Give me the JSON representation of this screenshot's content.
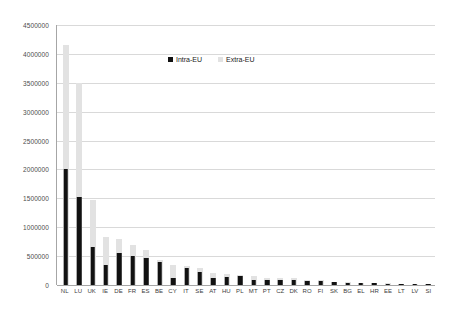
{
  "chart_data": {
    "type": "bar",
    "title": "",
    "subtitle": "",
    "xlabel": "",
    "ylabel": "",
    "ylim": [
      0,
      4500000
    ],
    "ytick_step": 500000,
    "ytick_labels": [
      "4500000",
      "4000000",
      "3500000",
      "3000000",
      "2500000",
      "2000000",
      "1500000",
      "1000000",
      "500000",
      "0"
    ],
    "grid": true,
    "grid_axis": "y",
    "legend_position": "top-center",
    "bar_style": "overlaid",
    "categories": [
      "NL",
      "LU",
      "UK",
      "IE",
      "DE",
      "FR",
      "ES",
      "BE",
      "CY",
      "IT",
      "SE",
      "AT",
      "HU",
      "PL",
      "MT",
      "PT",
      "CZ",
      "DK",
      "RO",
      "FI",
      "SK",
      "BG",
      "EL",
      "HR",
      "EE",
      "LT",
      "LV",
      "SI"
    ],
    "series": [
      {
        "name": "Intra-EU",
        "color": "#111111",
        "values": [
          2010000,
          1520000,
          660000,
          350000,
          555000,
          505000,
          475000,
          390000,
          130000,
          290000,
          220000,
          130000,
          145000,
          160000,
          90000,
          90000,
          95000,
          95000,
          70000,
          70000,
          45000,
          35000,
          30000,
          30000,
          20000,
          18000,
          15000,
          12000
        ]
      },
      {
        "name": "Extra-EU",
        "color": "#E2E2E2",
        "values": [
          4150000,
          3500000,
          1470000,
          830000,
          790000,
          690000,
          605000,
          430000,
          350000,
          330000,
          300000,
          215000,
          185000,
          180000,
          160000,
          130000,
          120000,
          115000,
          95000,
          90000,
          60000,
          50000,
          42000,
          40000,
          28000,
          25000,
          20000,
          16000
        ]
      }
    ]
  },
  "legend": {
    "items": [
      {
        "label": "Intra-EU"
      },
      {
        "label": "Extra-EU"
      }
    ]
  }
}
